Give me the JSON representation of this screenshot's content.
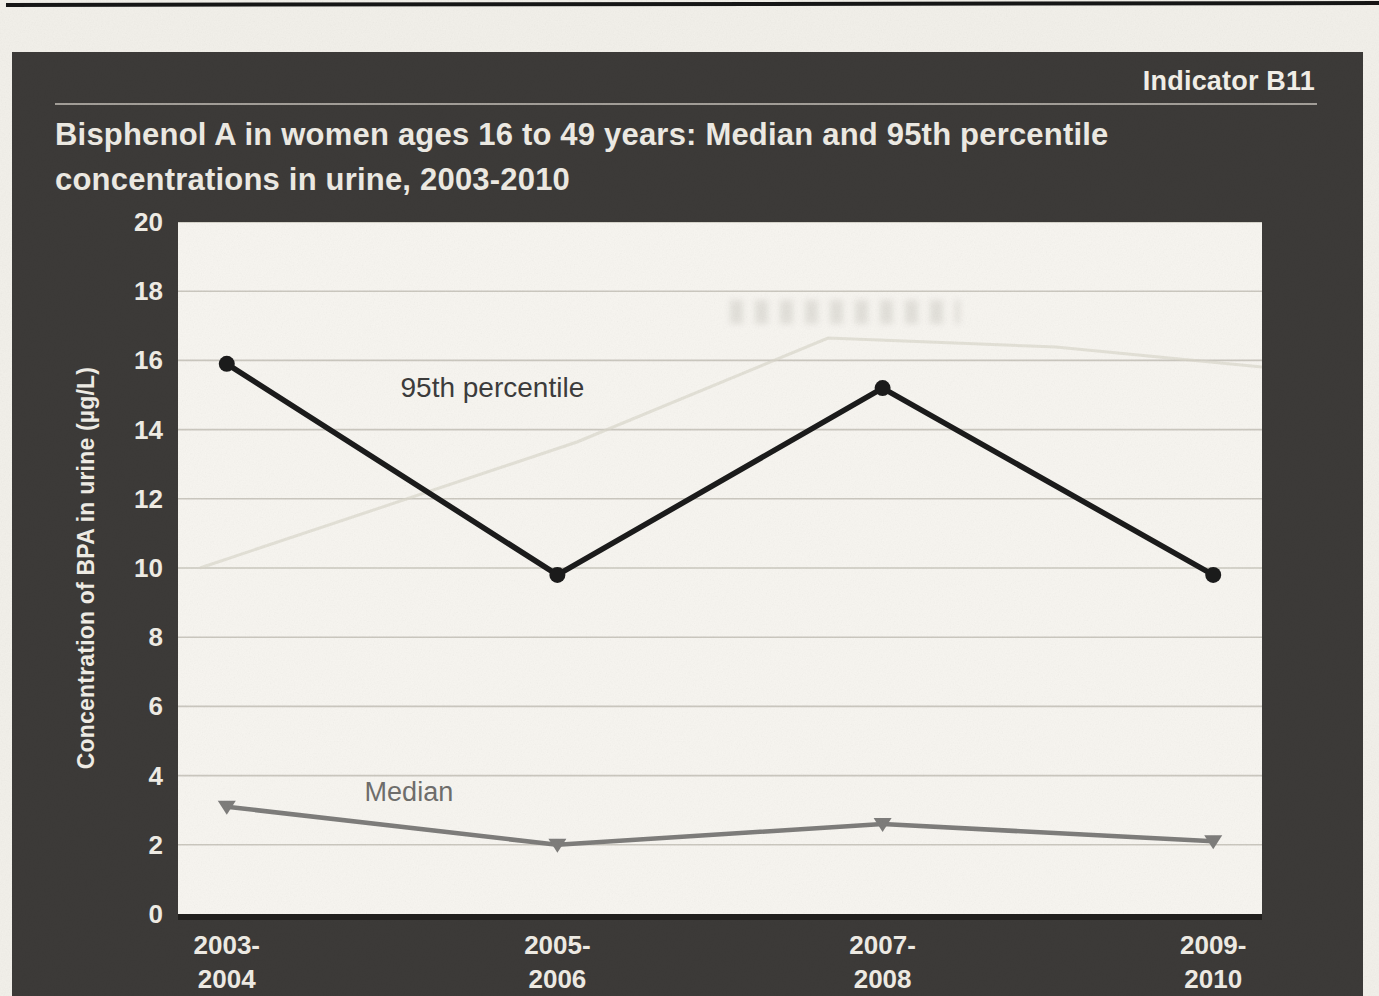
{
  "page": {
    "indicator_label": "Indicator B11",
    "title_line1": "Bisphenol A in women ages 16 to 49 years: Median and 95th percentile",
    "title_line2": "concentrations in urine, 2003-2010"
  },
  "chart_data": {
    "type": "line",
    "title": "Bisphenol A in women ages 16 to 49 years: Median and 95th percentile concentrations in urine, 2003-2010",
    "categories": [
      "2003-2004",
      "2005-2006",
      "2007-2008",
      "2009-2010"
    ],
    "category_labels": [
      [
        "2003-",
        "2004"
      ],
      [
        "2005-",
        "2006"
      ],
      [
        "2007-",
        "2008"
      ],
      [
        "2009-",
        "2010"
      ]
    ],
    "x_fractions": [
      0.045,
      0.35,
      0.65,
      0.955
    ],
    "series": [
      {
        "name": "95th percentile",
        "values": [
          15.9,
          9.8,
          15.2,
          9.8
        ],
        "color": "#1b1b1b",
        "marker": "circle",
        "line_width": 5.5
      },
      {
        "name": "Median",
        "values": [
          3.1,
          2.0,
          2.6,
          2.1
        ],
        "color": "#7e7d7b",
        "marker": "triangle-down",
        "line_width": 4.5
      }
    ],
    "annotations": [
      {
        "text": "95th percentile",
        "x_frac": 0.29,
        "y_frac": 0.253,
        "color": "#3c3c3c",
        "font_size": 28
      },
      {
        "text": "Median",
        "x_frac": 0.213,
        "y_frac": 0.836,
        "color": "#6f6e6c",
        "font_size": 27
      }
    ],
    "xlabel": "",
    "ylabel": "Concentration of BPA in urine (µg/L)",
    "ylim": [
      0,
      20
    ],
    "ytick_step": 2,
    "grid": true,
    "gridline_color": "#cbc8bf",
    "plot_background": "#f7f5f0",
    "panel_background": "#3c3a38",
    "legend_position": "inline-annotations"
  }
}
